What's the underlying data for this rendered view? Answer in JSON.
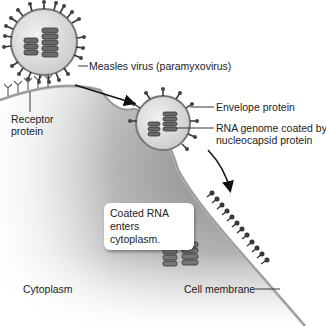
{
  "labels": {
    "virus": "Measles virus (paramyxovirus)",
    "receptor_line1": "Receptor",
    "receptor_line2": "protein",
    "envelope": "Envelope protein",
    "rna_line1": "RNA genome coated by",
    "rna_line2": "nucleocapsid protein",
    "callout_line1": "Coated RNA",
    "callout_line2": "enters cytoplasm.",
    "cytoplasm": "Cytoplasm",
    "cell_membrane": "Cell membrane"
  },
  "colors": {
    "cell_fill_dark": "#8f8f8f",
    "cell_fill_light": "#f2f2f2",
    "virus_fill": "#dcdcdc",
    "spike": "#333333",
    "label_text": "#222222"
  }
}
